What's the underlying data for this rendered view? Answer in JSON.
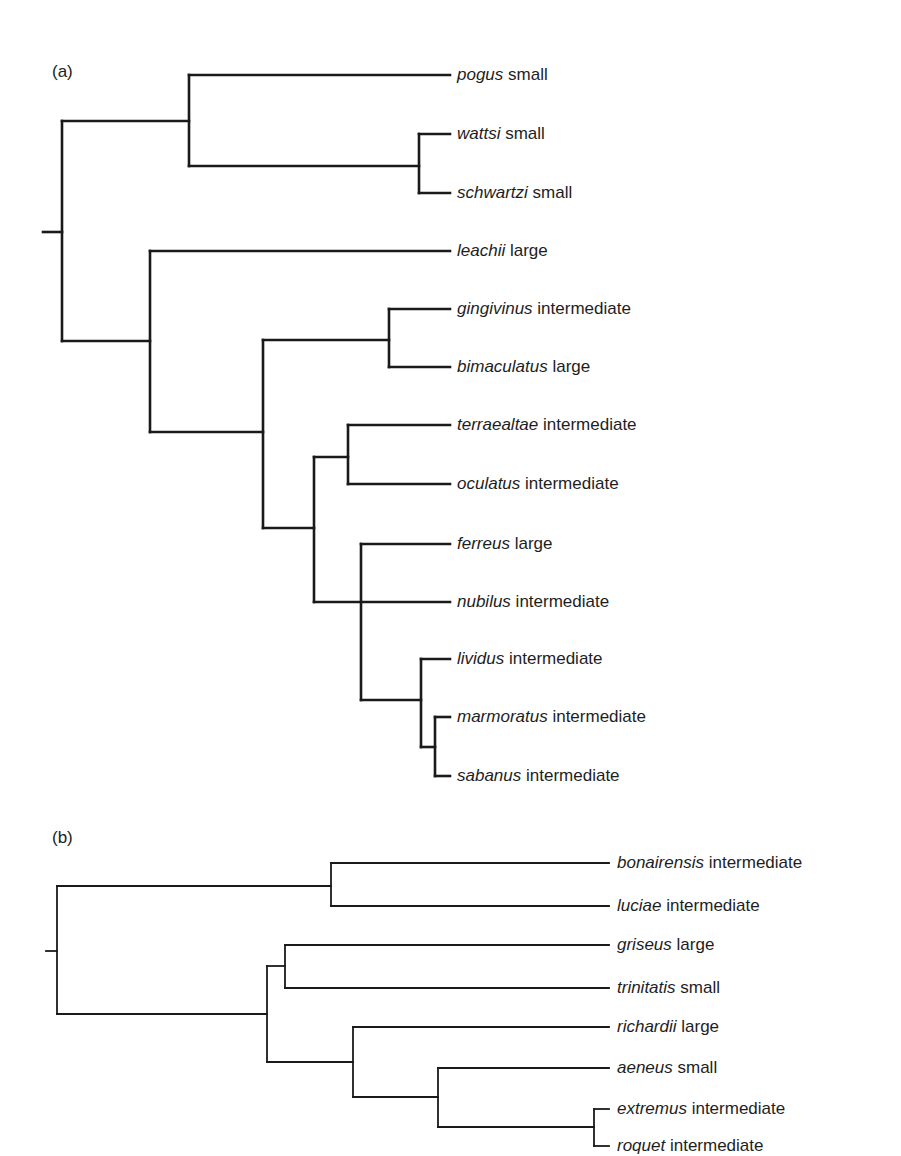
{
  "figure": {
    "panel_a": {
      "label": "(a)",
      "label_pos": [
        52,
        62
      ],
      "stroke_width": 2.6,
      "stroke_color": "#1a1a1a",
      "tip_x": 450,
      "text_x": 457,
      "tips": [
        {
          "species": "pogus",
          "size": "small",
          "y": 75
        },
        {
          "species": "wattsi",
          "size": "small",
          "y": 134
        },
        {
          "species": "schwartzi",
          "size": "small",
          "y": 193
        },
        {
          "species": "leachii",
          "size": " large",
          "y": 251
        },
        {
          "species": "gingivinus",
          "size": "intermediate",
          "y": 309
        },
        {
          "species": "bimaculatus",
          "size": "large",
          "y": 367
        },
        {
          "species": "terraealtae",
          "size": "intermediate",
          "y": 425
        },
        {
          "species": "oculatus",
          "size": "intermediate",
          "y": 484
        },
        {
          "species": "ferreus",
          "size": "large",
          "y": 544
        },
        {
          "species": "nubilus",
          "size": "intermediate",
          "y": 602
        },
        {
          "species": "lividus",
          "size": "intermediate",
          "y": 659
        },
        {
          "species": "marmoratus",
          "size": "intermediate",
          "y": 717
        },
        {
          "species": "sabanus",
          "size": "intermediate",
          "y": 776
        }
      ],
      "segments": [
        [
          43,
          232,
          62,
          232
        ],
        [
          62,
          121,
          62,
          341
        ],
        [
          62,
          121,
          189,
          121
        ],
        [
          189,
          75,
          189,
          166
        ],
        [
          189,
          75,
          450,
          75
        ],
        [
          189,
          166,
          419,
          166
        ],
        [
          419,
          134,
          419,
          193
        ],
        [
          419,
          134,
          450,
          134
        ],
        [
          419,
          193,
          450,
          193
        ],
        [
          62,
          341,
          150,
          341
        ],
        [
          150,
          251,
          150,
          432
        ],
        [
          150,
          251,
          450,
          251
        ],
        [
          150,
          432,
          263,
          432
        ],
        [
          263,
          340,
          263,
          528
        ],
        [
          263,
          340,
          389,
          340
        ],
        [
          389,
          309,
          389,
          367
        ],
        [
          389,
          309,
          450,
          309
        ],
        [
          389,
          367,
          450,
          367
        ],
        [
          263,
          528,
          314,
          528
        ],
        [
          314,
          457,
          314,
          602
        ],
        [
          314,
          457,
          348,
          457
        ],
        [
          348,
          425,
          348,
          484
        ],
        [
          348,
          425,
          450,
          425
        ],
        [
          348,
          484,
          450,
          484
        ],
        [
          314,
          602,
          450,
          602
        ],
        [
          361,
          544,
          361,
          700
        ],
        [
          361,
          544,
          450,
          544
        ],
        [
          361,
          700,
          421,
          700
        ],
        [
          421,
          659,
          421,
          747
        ],
        [
          421,
          659,
          450,
          659
        ],
        [
          421,
          747,
          435,
          747
        ],
        [
          435,
          717,
          435,
          776
        ],
        [
          435,
          717,
          450,
          717
        ],
        [
          435,
          776,
          450,
          776
        ]
      ]
    },
    "panel_b": {
      "label": "(b)",
      "label_pos": [
        52,
        828
      ],
      "stroke_width": 1.8,
      "stroke_color": "#1a1a1a",
      "tip_x": 609,
      "text_x": 617,
      "tips": [
        {
          "species": "bonairensis",
          "size": "intermediate",
          "y": 863
        },
        {
          "species": "luciae",
          "size": "intermediate",
          "y": 906
        },
        {
          "species": "griseus",
          "size": "large",
          "y": 945
        },
        {
          "species": "trinitatis",
          "size": "small",
          "y": 988
        },
        {
          "species": "richardii",
          "size": "large",
          "y": 1027
        },
        {
          "species": "aeneus",
          "size": "small",
          "y": 1068
        },
        {
          "species": "extremus",
          "size": "intermediate",
          "y": 1109
        },
        {
          "species": "roquet",
          "size": "intermediate",
          "y": 1146
        }
      ],
      "segments": [
        [
          46,
          951,
          57,
          951
        ],
        [
          57,
          886,
          57,
          1014
        ],
        [
          57,
          886,
          331,
          886
        ],
        [
          331,
          863,
          331,
          906
        ],
        [
          331,
          863,
          609,
          863
        ],
        [
          331,
          906,
          609,
          906
        ],
        [
          57,
          1014,
          267,
          1014
        ],
        [
          267,
          966,
          267,
          1062
        ],
        [
          267,
          966,
          285,
          966
        ],
        [
          285,
          945,
          285,
          988
        ],
        [
          285,
          945,
          609,
          945
        ],
        [
          285,
          988,
          609,
          988
        ],
        [
          267,
          1062,
          353,
          1062
        ],
        [
          353,
          1027,
          353,
          1097
        ],
        [
          353,
          1027,
          609,
          1027
        ],
        [
          353,
          1097,
          438,
          1097
        ],
        [
          438,
          1068,
          438,
          1127
        ],
        [
          438,
          1068,
          609,
          1068
        ],
        [
          438,
          1127,
          594,
          1127
        ],
        [
          594,
          1109,
          594,
          1146
        ],
        [
          594,
          1109,
          609,
          1109
        ],
        [
          594,
          1146,
          609,
          1146
        ]
      ]
    }
  }
}
